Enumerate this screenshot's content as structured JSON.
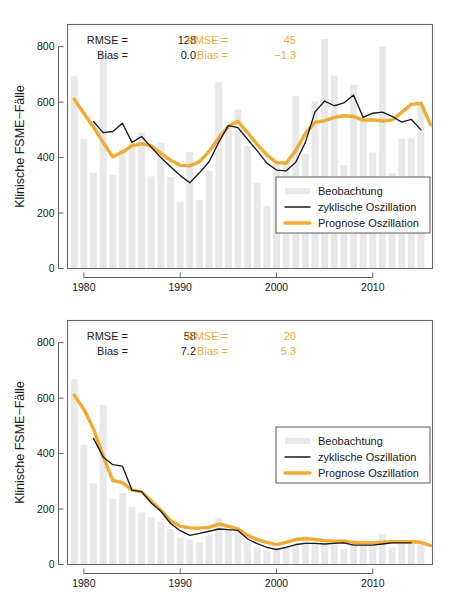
{
  "figure": {
    "background_color": "#ffffff",
    "panel_count": 2
  },
  "colors": {
    "observation_bar": "#e8e8e8",
    "cyclic_line": "#1a1a1a",
    "forecast_line": "#efab33",
    "axis": "#5d5d5d",
    "frame": "#6a6a6a"
  },
  "axis": {
    "ylabel": "Klinische FSME−Fälle",
    "yticks": [
      "0",
      "200",
      "400",
      "600",
      "800"
    ],
    "ytick_values": [
      0,
      200,
      400,
      600,
      800
    ],
    "xticks": [
      "1980",
      "1990",
      "2000",
      "2010"
    ],
    "xtick_values": [
      1980,
      1990,
      2000,
      2010
    ],
    "xlim": [
      1978.3,
      2016.2
    ],
    "ylim": [
      0,
      880
    ]
  },
  "legend": {
    "entries": [
      {
        "label": "Beobachtung",
        "style": "bar",
        "color": "#e8e8e8"
      },
      {
        "label": "zyklische Oszillation",
        "style": "line-thin",
        "color": "#1a1a1a"
      },
      {
        "label": "Prognose Oszillation",
        "style": "line-thick",
        "color": "#efab33"
      }
    ]
  },
  "panels": [
    {
      "id": "panel-top",
      "stats": {
        "black": {
          "rmse_label": "RMSE =",
          "rmse_value": "128",
          "bias_label": "Bias =",
          "bias_value": "0.0"
        },
        "orange": {
          "rmse_label": "RMSE =",
          "rmse_value": "45",
          "bias_label": "Bias =",
          "bias_value": "−1.3"
        }
      }
    },
    {
      "id": "panel-bottom",
      "stats": {
        "black": {
          "rmse_label": "RMSE =",
          "rmse_value": "58",
          "bias_label": "Bias =",
          "bias_value": "7.2"
        },
        "orange": {
          "rmse_label": "RMSE =",
          "rmse_value": "20",
          "bias_label": "Bias =",
          "bias_value": "5.3"
        }
      }
    }
  ],
  "chart_data": [
    {
      "type": "bar",
      "id": "panel-top",
      "title": "",
      "xlabel": "",
      "ylabel": "Klinische FSME−Fälle",
      "xlim": [
        1978.3,
        2016.2
      ],
      "ylim": [
        0,
        880
      ],
      "grid": false,
      "legend_position": "bottom-right",
      "x": [
        1979,
        1980,
        1981,
        1982,
        1983,
        1984,
        1985,
        1986,
        1987,
        1988,
        1989,
        1990,
        1991,
        1992,
        1993,
        1994,
        1995,
        1996,
        1997,
        1998,
        1999,
        2000,
        2001,
        2002,
        2003,
        2004,
        2005,
        2006,
        2007,
        2008,
        2009,
        2010,
        2011,
        2012,
        2013,
        2014,
        2015,
        2016
      ],
      "series": [
        {
          "name": "Beobachtung",
          "type": "bar",
          "color": "#e8e8e8",
          "values": [
            695,
            468,
            345,
            780,
            338,
            430,
            452,
            490,
            332,
            453,
            330,
            239,
            420,
            247,
            352,
            672,
            515,
            573,
            442,
            308,
            225,
            377,
            384,
            622,
            414,
            602,
            828,
            696,
            374,
            663,
            546,
            418,
            800,
            345,
            468,
            470,
            588,
            null
          ]
        },
        {
          "name": "zyklische Oszillation",
          "type": "line",
          "color": "#1a1a1a",
          "values": [
            null,
            null,
            530,
            490,
            494,
            524,
            455,
            476,
            437,
            400,
            367,
            335,
            309,
            345,
            385,
            455,
            515,
            508,
            466,
            424,
            380,
            355,
            352,
            383,
            455,
            565,
            604,
            587,
            597,
            626,
            545,
            560,
            564,
            549,
            528,
            538,
            500,
            null
          ]
        },
        {
          "name": "Prognose Oszillation",
          "type": "line",
          "color": "#efab33",
          "values": [
            611,
            560,
            510,
            455,
            403,
            420,
            443,
            450,
            442,
            415,
            390,
            372,
            370,
            385,
            422,
            470,
            512,
            531,
            490,
            448,
            410,
            382,
            380,
            425,
            487,
            527,
            533,
            545,
            551,
            548,
            535,
            536,
            532,
            536,
            563,
            592,
            596,
            519
          ]
        }
      ]
    },
    {
      "type": "bar",
      "id": "panel-bottom",
      "title": "",
      "xlabel": "",
      "ylabel": "Klinische FSME−Fälle",
      "xlim": [
        1978.3,
        2016.2
      ],
      "ylim": [
        0,
        880
      ],
      "grid": false,
      "legend_position": "center-right",
      "x": [
        1979,
        1980,
        1981,
        1982,
        1983,
        1984,
        1985,
        1986,
        1987,
        1988,
        1989,
        1990,
        1991,
        1992,
        1993,
        1994,
        1995,
        1996,
        1997,
        1998,
        1999,
        2000,
        2001,
        2002,
        2003,
        2004,
        2005,
        2006,
        2007,
        2008,
        2009,
        2010,
        2011,
        2012,
        2013,
        2014,
        2015,
        2016
      ],
      "series": [
        {
          "name": "Beobachtung",
          "type": "bar",
          "color": "#e8e8e8",
          "values": [
            668,
            433,
            292,
            576,
            236,
            258,
            208,
            188,
            170,
            155,
            128,
            96,
            90,
            80,
            105,
            168,
            130,
            122,
            80,
            62,
            50,
            60,
            68,
            72,
            90,
            80,
            78,
            72,
            55,
            80,
            68,
            72,
            110,
            62,
            82,
            78,
            80,
            null
          ]
        },
        {
          "name": "zyklische Oszillation",
          "type": "line",
          "color": "#1a1a1a",
          "values": [
            null,
            null,
            455,
            388,
            360,
            355,
            268,
            263,
            222,
            192,
            148,
            122,
            105,
            112,
            120,
            128,
            126,
            123,
            92,
            75,
            62,
            54,
            62,
            72,
            76,
            76,
            74,
            76,
            78,
            70,
            70,
            70,
            74,
            78,
            78,
            78,
            null,
            null
          ]
        },
        {
          "name": "Prognose Oszillation",
          "type": "line",
          "color": "#efab33",
          "values": [
            611,
            560,
            490,
            390,
            303,
            295,
            268,
            262,
            228,
            196,
            158,
            138,
            132,
            131,
            134,
            146,
            138,
            128,
            105,
            90,
            80,
            72,
            80,
            90,
            94,
            90,
            86,
            84,
            84,
            80,
            78,
            78,
            80,
            82,
            82,
            82,
            80,
            68
          ]
        }
      ]
    }
  ]
}
